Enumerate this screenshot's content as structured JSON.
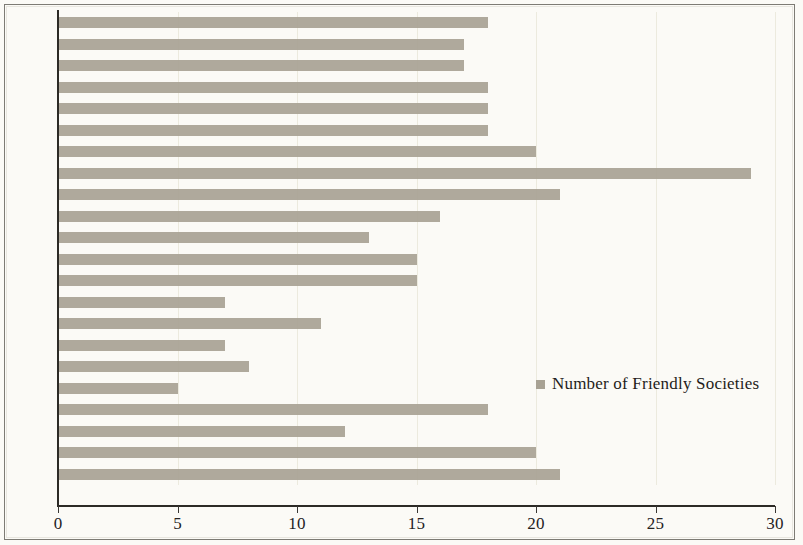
{
  "chart_data": {
    "type": "bar",
    "orientation": "horizontal",
    "title": "",
    "xlabel": "",
    "ylabel": "",
    "xlim": [
      0,
      30
    ],
    "xticks": [
      0,
      5,
      10,
      15,
      20,
      25,
      30
    ],
    "grid": true,
    "grid_axis": "x",
    "legend_position": "inside-right",
    "bar_color": "#a8a294",
    "background_color": "#fbfaf6",
    "axis_color": "#2c2a26",
    "series": [
      {
        "name": "Number of Friendly Societies",
        "values": [
          18,
          17,
          17,
          18,
          18,
          18,
          20,
          29,
          21,
          16,
          13,
          15,
          15,
          7,
          11,
          7,
          8,
          5,
          18,
          12,
          20,
          21
        ]
      }
    ],
    "categories": [
      "1910",
      "1909",
      "1908",
      "1907",
      "1906",
      "1905",
      "1902",
      "1893",
      "1892",
      "1891",
      "1890",
      "1888",
      "1887",
      "1875",
      "1874",
      "1873",
      "1872",
      "1871",
      "1858",
      "1856",
      "1855",
      "1854"
    ]
  },
  "legend": {
    "entries": [
      {
        "label": "Number of Friendly Societies",
        "color": "#a8a294"
      }
    ]
  },
  "axis": {
    "x_tick_labels": [
      "0",
      "5",
      "10",
      "15",
      "20",
      "25",
      "30"
    ]
  }
}
